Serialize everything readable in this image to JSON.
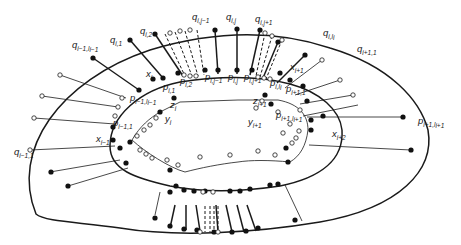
{
  "figure": {
    "colors": {
      "stroke": "#1a1a1a",
      "filled_node": "#111111",
      "open_node": "#ffffff",
      "background": "#ffffff"
    }
  },
  "curves": {
    "outer": "M 36 214 C 10 150, 60 80, 150 50 C 210 32, 270 28, 330 48 C 390 66, 420 100, 428 130 C 435 170, 400 208, 320 222 C 260 232, 180 238, 120 228 C 80 222, 45 222, 36 214 Z",
    "middle": "M 110 146 C 110 116, 140 90, 180 82 C 220 76, 260 76, 290 84 C 320 92, 340 110, 342 130 C 344 160, 320 178, 280 186 C 240 192, 200 192, 170 186 C 135 178, 110 170, 110 146 Z",
    "inner": "M 132 140 C 140 126, 150 118, 160 112 L 180 102 L 238 100 L 278 100 C 300 104, 308 116, 308 130 C 306 146, 300 156, 290 162 C 270 160, 250 160, 238 162 C 220 164, 200 168, 185 172 C 170 168, 145 152, 132 140 Z"
  },
  "spokes_thick": [
    [
      130,
      40,
      163,
      78
    ],
    [
      155,
      34,
      183,
      76
    ],
    [
      215,
      30,
      218,
      74
    ],
    [
      237,
      30,
      237,
      74
    ],
    [
      260,
      30,
      250,
      75
    ],
    [
      278,
      42,
      263,
      78
    ],
    [
      305,
      55,
      277,
      83
    ],
    [
      93,
      58,
      139,
      90
    ],
    [
      175,
      205,
      170,
      228
    ],
    [
      186,
      205,
      186,
      230
    ],
    [
      196,
      205,
      200,
      231
    ],
    [
      216,
      205,
      218,
      232
    ],
    [
      226,
      205,
      232,
      232
    ],
    [
      237,
      205,
      244,
      232
    ],
    [
      247,
      205,
      256,
      231
    ]
  ],
  "spokes_thin": [
    [
      60,
      75,
      126,
      98
    ],
    [
      42,
      96,
      118,
      107
    ],
    [
      34,
      118,
      115,
      124
    ],
    [
      30,
      150,
      115,
      146
    ],
    [
      50,
      172,
      120,
      160
    ],
    [
      68,
      186,
      128,
      168
    ],
    [
      322,
      60,
      285,
      88
    ],
    [
      340,
      80,
      295,
      95
    ],
    [
      353,
      95,
      300,
      104
    ],
    [
      358,
      105,
      303,
      116
    ],
    [
      403,
      117,
      307,
      117
    ],
    [
      411,
      150,
      309,
      145
    ],
    [
      155,
      215,
      160,
      192
    ],
    [
      302,
      221,
      285,
      185
    ]
  ],
  "spokes_dashed": [
    [
      165,
      34,
      185,
      76
    ],
    [
      175,
      32,
      192,
      76
    ],
    [
      185,
      31,
      198,
      76
    ],
    [
      197,
      30,
      204,
      75
    ],
    [
      265,
      33,
      256,
      76
    ],
    [
      272,
      36,
      260,
      77
    ],
    [
      282,
      40,
      266,
      79
    ],
    [
      205,
      206,
      205,
      232
    ],
    [
      210,
      206,
      210,
      232
    ],
    [
      214,
      206,
      214,
      232
    ],
    [
      218,
      206,
      218,
      232
    ]
  ],
  "nodes_full": [
    [
      93,
      58
    ],
    [
      130,
      40
    ],
    [
      155,
      34
    ],
    [
      215,
      30
    ],
    [
      237,
      29
    ],
    [
      260,
      30
    ],
    [
      278,
      42
    ],
    [
      305,
      55
    ],
    [
      139,
      90
    ],
    [
      153,
      79
    ],
    [
      163,
      78
    ],
    [
      178,
      73
    ],
    [
      205,
      70
    ],
    [
      218,
      70
    ],
    [
      237,
      70
    ],
    [
      252,
      70
    ],
    [
      280,
      73
    ],
    [
      290,
      80
    ],
    [
      303,
      86
    ],
    [
      174,
      98
    ],
    [
      265,
      95
    ],
    [
      160,
      112
    ],
    [
      271,
      104
    ],
    [
      113,
      127
    ],
    [
      113,
      140
    ],
    [
      130,
      142
    ],
    [
      120,
      148
    ],
    [
      126,
      163
    ],
    [
      286,
      148
    ],
    [
      311,
      130
    ],
    [
      311,
      120
    ],
    [
      307,
      101
    ],
    [
      323,
      116
    ],
    [
      403,
      117
    ],
    [
      411,
      150
    ],
    [
      51,
      172
    ],
    [
      68,
      186
    ],
    [
      155,
      218
    ],
    [
      170,
      226
    ],
    [
      184,
      229
    ],
    [
      197,
      230
    ],
    [
      214,
      232
    ],
    [
      232,
      232
    ],
    [
      246,
      231
    ],
    [
      258,
      228
    ],
    [
      295,
      220
    ],
    [
      170,
      192
    ],
    [
      176,
      186
    ],
    [
      184,
      190
    ],
    [
      194,
      191
    ],
    [
      205,
      191
    ],
    [
      230,
      191
    ],
    [
      240,
      191
    ],
    [
      250,
      189
    ],
    [
      270,
      185
    ],
    [
      278,
      184
    ],
    [
      170,
      170
    ],
    [
      288,
      162
    ]
  ],
  "nodes_open": [
    [
      60,
      75
    ],
    [
      42,
      96
    ],
    [
      34,
      118
    ],
    [
      30,
      150
    ],
    [
      122,
      98
    ],
    [
      118,
      107
    ],
    [
      115,
      116
    ],
    [
      170,
      33
    ],
    [
      180,
      31
    ],
    [
      190,
      30
    ],
    [
      265,
      33
    ],
    [
      272,
      36
    ],
    [
      282,
      40
    ],
    [
      322,
      60
    ],
    [
      340,
      80
    ],
    [
      353,
      95
    ],
    [
      184,
      75
    ],
    [
      190,
      76
    ],
    [
      196,
      76
    ],
    [
      258,
      77
    ],
    [
      264,
      78
    ],
    [
      270,
      79
    ],
    [
      262,
      101
    ],
    [
      256,
      108
    ],
    [
      278,
      112
    ],
    [
      137,
      136
    ],
    [
      144,
      130
    ],
    [
      150,
      125
    ],
    [
      156,
      118
    ],
    [
      167,
      160
    ],
    [
      178,
      165
    ],
    [
      200,
      157
    ],
    [
      230,
      155
    ],
    [
      258,
      151
    ],
    [
      275,
      155
    ],
    [
      283,
      133
    ],
    [
      290,
      124
    ],
    [
      300,
      110
    ],
    [
      203,
      192
    ],
    [
      213,
      192
    ],
    [
      200,
      232
    ],
    [
      218,
      232
    ],
    [
      140,
      150
    ],
    [
      146,
      154
    ],
    [
      152,
      158
    ],
    [
      299,
      131
    ],
    [
      296,
      138
    ],
    [
      292,
      143
    ]
  ],
  "labels": [
    {
      "main": "q",
      "sub": "i−1,l",
      "sub2": "i−1",
      "x": 72,
      "y": 48
    },
    {
      "main": "q",
      "sub": "i,1",
      "x": 110,
      "y": 43
    },
    {
      "main": "q",
      "sub": "i,2",
      "x": 140,
      "y": 34
    },
    {
      "main": "q",
      "sub": "i,j−1",
      "x": 192,
      "y": 20
    },
    {
      "main": "q",
      "sub": "i,j",
      "x": 226,
      "y": 20
    },
    {
      "main": "q",
      "sub": "i,j+1",
      "x": 255,
      "y": 22
    },
    {
      "main": "q",
      "sub": "i,l",
      "sub2": "i",
      "x": 323,
      "y": 36
    },
    {
      "main": "q",
      "sub": "i+1,1",
      "x": 357,
      "y": 52
    },
    {
      "main": "x",
      "sub": "i",
      "x": 146,
      "y": 77
    },
    {
      "main": "p",
      "sub": "i,1",
      "x": 163,
      "y": 90
    },
    {
      "main": "p",
      "sub": "i,2",
      "x": 180,
      "y": 84
    },
    {
      "main": "p",
      "sub": "i,j−1",
      "x": 205,
      "y": 80
    },
    {
      "main": "p",
      "sub": "i,j",
      "x": 228,
      "y": 80
    },
    {
      "main": "p",
      "sub": "i,j+1",
      "x": 244,
      "y": 80
    },
    {
      "main": "p",
      "sub": "i,l",
      "sub2": "i",
      "x": 270,
      "y": 86
    },
    {
      "main": "x",
      "sub": "i+1",
      "x": 290,
      "y": 70
    },
    {
      "main": "p",
      "sub": "i+1,1",
      "x": 286,
      "y": 92
    },
    {
      "main": "p",
      "sub": "i−1,l",
      "sub2": "i−1",
      "x": 130,
      "y": 101
    },
    {
      "main": "z",
      "sub": "i",
      "x": 170,
      "y": 108
    },
    {
      "main": "z",
      "sub": "i+1",
      "x": 253,
      "y": 104
    },
    {
      "main": "y",
      "sub": "i",
      "x": 165,
      "y": 122
    },
    {
      "main": "y",
      "sub": "i+1",
      "x": 248,
      "y": 125
    },
    {
      "main": "p",
      "sub": "i+1,l",
      "sub2": "i+1",
      "x": 276,
      "y": 118
    },
    {
      "main": "p",
      "sub": "i+1,l",
      "sub2": "i+1",
      "x": 418,
      "y": 124
    },
    {
      "main": "p",
      "sub": "i−1,1",
      "x": 113,
      "y": 126
    },
    {
      "main": "x",
      "sub": "i−1",
      "x": 96,
      "y": 142
    },
    {
      "main": "x",
      "sub": "i+2",
      "x": 332,
      "y": 137
    },
    {
      "main": "q",
      "sub": "i−1,1",
      "x": 14,
      "y": 155
    }
  ]
}
